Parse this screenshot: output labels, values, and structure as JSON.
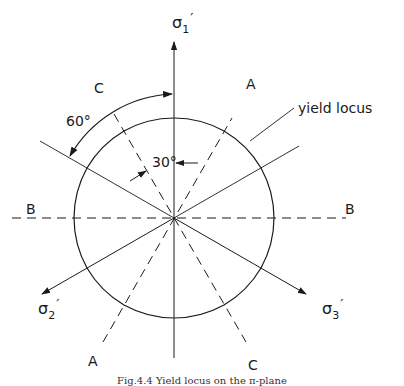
{
  "diagram": {
    "caption": "Fig.4.4  Yield locus on the π-plane",
    "center": {
      "x": 174,
      "y": 218
    },
    "locus_radius": 100,
    "colors": {
      "line": "#1a1a1a",
      "background": "#ffffff"
    },
    "axes": [
      {
        "id": "sigma1",
        "label_main": "σ",
        "label_sub": "1",
        "label_prime": "′",
        "direction_deg": 90
      },
      {
        "id": "sigma2",
        "label_main": "σ",
        "label_sub": "2",
        "label_prime": "′",
        "direction_deg": 210
      },
      {
        "id": "sigma3",
        "label_main": "σ",
        "label_sub": "3",
        "label_prime": "′",
        "direction_deg": 330
      }
    ],
    "dashed_lines": [
      {
        "id": "A",
        "label_top": "A",
        "label_bottom": "A",
        "direction_deg": 60
      },
      {
        "id": "B",
        "label_left": "B",
        "label_right": "B",
        "direction_deg": 0
      },
      {
        "id": "C",
        "label_top": "C",
        "label_bottom": "C",
        "direction_deg": 120
      }
    ],
    "angle_annotations": [
      {
        "label": "60°",
        "from_deg": 90,
        "to_deg": 150
      },
      {
        "label": "30°",
        "from_deg": 90,
        "to_deg": 120
      }
    ],
    "callouts": [
      {
        "label": "yield locus"
      }
    ]
  }
}
